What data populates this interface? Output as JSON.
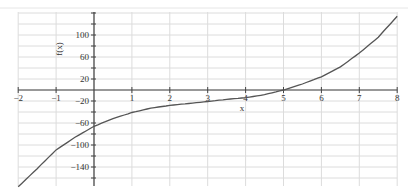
{
  "chart_data": {
    "type": "line",
    "title": "",
    "xlabel": "x",
    "ylabel": "f(x)",
    "xlim": [
      -2,
      8
    ],
    "ylim": [
      -175,
      140
    ],
    "grid": true,
    "legend": null,
    "x_ticks": [
      -2,
      -1,
      1,
      2,
      3,
      4,
      5,
      6,
      7,
      8
    ],
    "x_tick_labels": [
      "-2",
      "-1",
      "1",
      "2",
      "3",
      "4",
      "5",
      "6",
      "7",
      "8"
    ],
    "y_ticks": [
      100,
      60,
      20,
      -20,
      -60,
      -100,
      -140
    ],
    "y_tick_labels": [
      "100",
      "60",
      "20",
      "-20",
      "-60",
      "-100",
      "-140"
    ],
    "series": [
      {
        "name": "f(x)",
        "color": "#555555",
        "x": [
          -2,
          -1.5,
          -1,
          -0.5,
          0,
          0.5,
          1,
          1.5,
          2,
          2.5,
          3,
          3.5,
          4,
          4.5,
          5,
          5.5,
          6,
          6.5,
          7,
          7.5,
          8
        ],
        "values": [
          -176,
          -143,
          -109,
          -86,
          -66,
          -52,
          -41,
          -33,
          -28,
          -24.5,
          -21,
          -17,
          -14,
          -8.5,
          0,
          11,
          24,
          42,
          67,
          96,
          134
        ]
      }
    ]
  }
}
